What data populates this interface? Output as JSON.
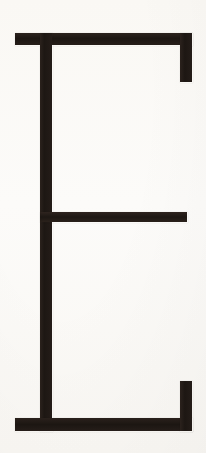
{
  "image": {
    "title": "Letter E",
    "subject": "uppercase-letter-E",
    "character": "E",
    "style": "slab-serif stencil-like capital",
    "width_px": 206,
    "height_px": 453,
    "background_color": "#fbfaf8",
    "ink_color": "#211a16"
  },
  "glyph": {
    "name": "E",
    "strokes": [
      {
        "id": "stem",
        "label": "vertical stem",
        "x": 40,
        "y": 33,
        "width": 12,
        "height": 398
      },
      {
        "id": "arm-top",
        "label": "top horizontal arm",
        "x": 15,
        "y": 33,
        "width": 177,
        "height": 12
      },
      {
        "id": "serif-top-right",
        "label": "downward serif at top right",
        "x": 180,
        "y": 33,
        "width": 12,
        "height": 49
      },
      {
        "id": "arm-middle",
        "label": "middle horizontal arm",
        "x": 40,
        "y": 212,
        "width": 147,
        "height": 10
      },
      {
        "id": "arm-bottom",
        "label": "bottom horizontal arm",
        "x": 15,
        "y": 418,
        "width": 177,
        "height": 13
      },
      {
        "id": "serif-bottom-right",
        "label": "upward serif at bottom right",
        "x": 180,
        "y": 381,
        "width": 12,
        "height": 50
      }
    ]
  }
}
